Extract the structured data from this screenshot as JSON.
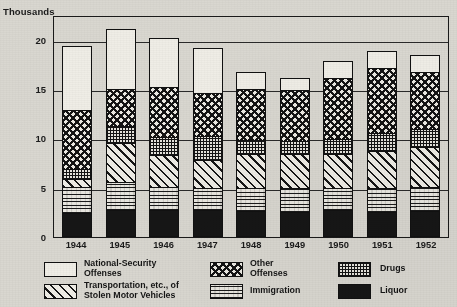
{
  "chart_data": {
    "type": "bar",
    "subtype": "stacked-bar",
    "title": "",
    "xlabel": "",
    "ylabel": "Thousands",
    "ylim": [
      0,
      22.5
    ],
    "yticks": [
      0,
      5,
      10,
      15,
      20
    ],
    "ytick_labels": [
      "0",
      "5",
      "10",
      "15",
      "20"
    ],
    "grid": true,
    "grid_axis": "y",
    "legend_position": "bottom",
    "units": "Thousands",
    "categories": [
      "1944",
      "1945",
      "1946",
      "1947",
      "1948",
      "1949",
      "1950",
      "1951",
      "1952"
    ],
    "series": [
      {
        "name": "Liquor",
        "pattern": "solid-black",
        "color": "#161616",
        "values": [
          2.3,
          2.6,
          2.6,
          2.6,
          2.5,
          2.4,
          2.6,
          2.4,
          2.5
        ]
      },
      {
        "name": "Immigration",
        "pattern": "horizontal-dash",
        "color": "#eae8e1",
        "values": [
          2.7,
          2.9,
          2.4,
          2.3,
          2.4,
          2.5,
          2.3,
          2.5,
          2.5
        ]
      },
      {
        "name": "Transportation, etc., of Stolen Motor Vehicles",
        "pattern": "diagonal-hatch",
        "color": "#efede6",
        "values": [
          0.8,
          3.9,
          3.2,
          2.8,
          3.4,
          3.4,
          3.4,
          3.7,
          4.0
        ]
      },
      {
        "name": "Drugs",
        "pattern": "fine-grid",
        "color": "#e7e5de",
        "values": [
          1.0,
          1.8,
          1.8,
          2.4,
          1.4,
          1.3,
          1.5,
          1.8,
          1.9
        ]
      },
      {
        "name": "Other Offenses",
        "pattern": "checkerboard",
        "color": "#eceae3",
        "values": [
          6.0,
          3.7,
          5.1,
          4.4,
          5.2,
          5.2,
          6.2,
          6.6,
          5.7
        ]
      },
      {
        "name": "National-Security Offenses",
        "pattern": "blank-white",
        "color": "#efede6",
        "values": [
          6.4,
          6.0,
          4.9,
          4.5,
          1.6,
          1.1,
          1.6,
          1.7,
          1.7
        ]
      }
    ],
    "totals": [
      19.2,
      20.9,
      20.0,
      19.0,
      16.5,
      15.9,
      17.6,
      18.7,
      18.3
    ]
  },
  "legend": {
    "items": [
      {
        "label": "National-Security Offenses",
        "line1": "National-Security",
        "line2": "Offenses",
        "swatch": "blank-white-swatch"
      },
      {
        "label": "Other Offenses",
        "line1": "Other",
        "line2": "Offenses",
        "swatch": "checkerboard-swatch"
      },
      {
        "label": "Drugs",
        "line1": "Drugs",
        "line2": "",
        "swatch": "fine-grid-swatch"
      },
      {
        "label": "Transportation, etc., of Stolen Motor Vehicles",
        "line1": "Transportation, etc., of",
        "line2": "Stolen Motor Vehicles",
        "swatch": "diagonal-hatch-swatch"
      },
      {
        "label": "Immigration",
        "line1": "Immigration",
        "line2": "",
        "swatch": "horizontal-dash-swatch"
      },
      {
        "label": "Liquor",
        "line1": "Liquor",
        "line2": "",
        "swatch": "solid-black-swatch"
      }
    ]
  }
}
